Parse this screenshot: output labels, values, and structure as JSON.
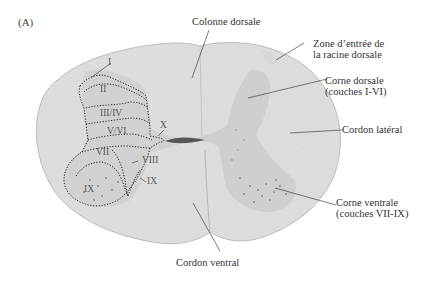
{
  "figure": {
    "panel_label": "(A)",
    "colors": {
      "white_matter": "#e2e2e2",
      "gray_matter": "#c9c9c9",
      "ventral_horn_dense": "#b5b5b5",
      "central_canal": "#555555",
      "outline": "#bdbdbd",
      "leader_line": "#444444",
      "laminae_border": "#222222",
      "text": "#333333"
    },
    "annotations": [
      {
        "id": "colonne-dorsale",
        "lines": [
          "Colonne dorsale"
        ]
      },
      {
        "id": "zone-entree",
        "lines": [
          "Zone d’entrée de",
          "la racine dorsale"
        ]
      },
      {
        "id": "corne-dorsale",
        "lines": [
          "Corne dorsale",
          "(couches I-VI)"
        ]
      },
      {
        "id": "cordon-lateral",
        "lines": [
          "Cordon latéral"
        ]
      },
      {
        "id": "corne-ventrale",
        "lines": [
          "Corne ventrale",
          "(couches VII-IX)"
        ]
      },
      {
        "id": "cordon-ventral",
        "lines": [
          "Cordon ventral"
        ]
      }
    ],
    "laminae": [
      "I",
      "II",
      "III/IV",
      "V/VI",
      "X",
      "VII",
      "VIII",
      "IX",
      "IX"
    ]
  }
}
